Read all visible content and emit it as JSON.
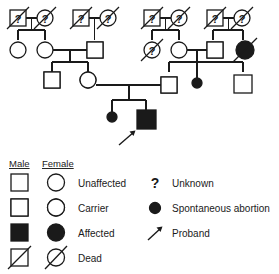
{
  "figure": {
    "type": "pedigree-chart",
    "title": "",
    "ink_color": "#1a1a1a",
    "background_color": "#ffffff"
  },
  "legend": {
    "column_headers": {
      "male": "Male",
      "female": "Female"
    },
    "rows": [
      {
        "key": "unaffected",
        "label": "Unaffected",
        "male_symbol": "open-square",
        "female_symbol": "open-circle"
      },
      {
        "key": "carrier",
        "label": "Carrier",
        "male_symbol": "half-filled-square",
        "female_symbol": "half-filled-circle"
      },
      {
        "key": "affected",
        "label": "Affected",
        "male_symbol": "filled-square",
        "female_symbol": "filled-circle"
      },
      {
        "key": "dead",
        "label": "Dead",
        "male_symbol": "slashed-square",
        "female_symbol": "slashed-circle"
      }
    ],
    "extra_rows": [
      {
        "key": "unknown",
        "label": "Unknown",
        "symbol": "question-mark"
      },
      {
        "key": "spontaneous-abortion",
        "label": "Spontaneous abortion",
        "symbol": "small-filled-circle"
      },
      {
        "key": "proband",
        "label": "Proband",
        "symbol": "arrow"
      }
    ]
  },
  "pedigree": {
    "generations": [
      {
        "id": "I",
        "individuals": [
          {
            "id": "I-1",
            "sex": "male",
            "status": "unknown",
            "dead": true,
            "marker": "?"
          },
          {
            "id": "I-2",
            "sex": "female",
            "status": "unknown",
            "dead": true,
            "marker": "?"
          },
          {
            "id": "I-3",
            "sex": "male",
            "status": "unknown",
            "dead": true,
            "marker": "?"
          },
          {
            "id": "I-4",
            "sex": "female",
            "status": "unknown",
            "dead": true,
            "marker": "?"
          },
          {
            "id": "I-5",
            "sex": "male",
            "status": "unknown",
            "dead": true,
            "marker": "?"
          },
          {
            "id": "I-6",
            "sex": "female",
            "status": "unknown",
            "dead": true,
            "marker": "?"
          },
          {
            "id": "I-7",
            "sex": "male",
            "status": "unknown",
            "dead": true,
            "marker": "?"
          },
          {
            "id": "I-8",
            "sex": "female",
            "status": "unknown",
            "dead": true,
            "marker": "?"
          }
        ]
      },
      {
        "id": "II",
        "individuals": [
          {
            "id": "II-1",
            "sex": "female",
            "status": "unaffected",
            "dead": false,
            "marker": ""
          },
          {
            "id": "II-2",
            "sex": "female",
            "status": "unaffected",
            "dead": false,
            "marker": ""
          },
          {
            "id": "II-3",
            "sex": "male",
            "status": "carrier",
            "dead": false,
            "marker": ""
          },
          {
            "id": "II-4",
            "sex": "female",
            "status": "unknown",
            "dead": true,
            "marker": "?"
          },
          {
            "id": "II-5",
            "sex": "female",
            "status": "unaffected",
            "dead": false,
            "marker": ""
          },
          {
            "id": "II-6",
            "sex": "male",
            "status": "carrier",
            "dead": false,
            "marker": ""
          },
          {
            "id": "II-7",
            "sex": "female",
            "status": "affected",
            "dead": true,
            "marker": ""
          }
        ]
      },
      {
        "id": "III",
        "individuals": [
          {
            "id": "III-1",
            "sex": "male",
            "status": "carrier",
            "dead": false,
            "marker": ""
          },
          {
            "id": "III-2",
            "sex": "female",
            "status": "carrier",
            "dead": false,
            "marker": ""
          },
          {
            "id": "III-3",
            "sex": "male",
            "status": "carrier",
            "dead": false,
            "marker": ""
          },
          {
            "id": "III-4",
            "sex": "unknown",
            "status": "spontaneous-abortion",
            "dead": false,
            "marker": ""
          },
          {
            "id": "III-5",
            "sex": "male",
            "status": "unaffected",
            "dead": false,
            "marker": ""
          }
        ]
      },
      {
        "id": "IV",
        "individuals": [
          {
            "id": "IV-1",
            "sex": "unknown",
            "status": "spontaneous-abortion",
            "dead": false,
            "marker": "",
            "proband": false
          },
          {
            "id": "IV-2",
            "sex": "male",
            "status": "affected",
            "dead": false,
            "marker": "",
            "proband": true
          }
        ]
      }
    ],
    "matings": [
      {
        "partners": [
          "I-1",
          "I-2"
        ],
        "children": [
          "II-1",
          "II-2"
        ]
      },
      {
        "partners": [
          "I-3",
          "I-4"
        ],
        "children": [
          "II-3"
        ]
      },
      {
        "partners": [
          "I-5",
          "I-6"
        ],
        "children": [
          "II-4",
          "II-5"
        ]
      },
      {
        "partners": [
          "I-7",
          "I-8"
        ],
        "children": [
          "II-6",
          "II-7"
        ]
      },
      {
        "partners": [
          "II-2",
          "II-3"
        ],
        "children": [
          "III-1",
          "III-2"
        ]
      },
      {
        "partners": [
          "II-5",
          "II-6"
        ],
        "children": [
          "III-3",
          "III-4",
          "III-5"
        ]
      },
      {
        "partners": [
          "III-2",
          "III-3"
        ],
        "children": [
          "IV-1",
          "IV-2"
        ]
      }
    ]
  }
}
